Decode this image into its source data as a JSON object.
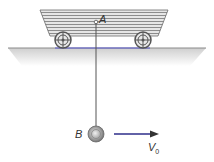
{
  "diagram": {
    "labels": {
      "point_a": "A",
      "point_b": "B",
      "velocity": "V",
      "velocity_sub": "0"
    },
    "colors": {
      "cart_fill": "#d9d9d9",
      "cart_stripe": "#8c8c8c",
      "ground_line": "#5a5ad0",
      "ground_shade": "#dcdcdc",
      "string": "#555555",
      "ball": "#9a9a9a",
      "arrow": "#2e2e8a"
    }
  }
}
